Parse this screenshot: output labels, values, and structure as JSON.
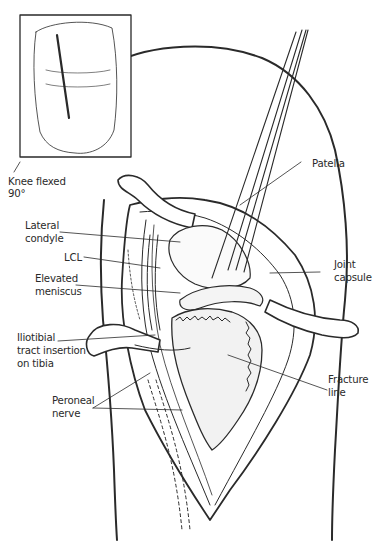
{
  "figure": {
    "type": "surgical-anatomical-illustration",
    "inset": {
      "caption_line1": "Knee flexed",
      "caption_line2": "90°"
    },
    "labels": {
      "patella": "Patella",
      "lateral_condyle_1": "Lateral",
      "lateral_condyle_2": "condyle",
      "lcl": "LCL",
      "elevated_meniscus_1": "Elevated",
      "elevated_meniscus_2": "meniscus",
      "joint_capsule_1": "Joint",
      "joint_capsule_2": "capsule",
      "iliotibial_1": "Iliotibial",
      "iliotibial_2": "tract insertion",
      "iliotibial_3": "on tibia",
      "fracture_line_1": "Fracture",
      "fracture_line_2": "line",
      "peroneal_nerve_1": "Peroneal",
      "peroneal_nerve_2": "nerve"
    },
    "colors": {
      "ink": "#2a2a2a",
      "background": "#ffffff",
      "shade": "#e6e6e6"
    }
  }
}
